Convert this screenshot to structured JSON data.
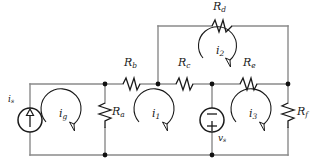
{
  "diagram": {
    "kind": "electrical-circuit-schematic",
    "title": "",
    "colors": {
      "wire": "#8a8a8a",
      "node": "#111111",
      "symbol": "#1a1a1a",
      "label": "#1a1a1a",
      "background": "#ffffff"
    },
    "components": [
      {
        "id": "Ra",
        "name": "resistor-Ra",
        "base": "R",
        "sub": "a",
        "orientation": "vertical",
        "label_x": 112,
        "label_y": 112
      },
      {
        "id": "Rb",
        "name": "resistor-Rb",
        "base": "R",
        "sub": "b",
        "orientation": "horizontal",
        "label_x": 124,
        "label_y": 63
      },
      {
        "id": "Rc",
        "name": "resistor-Rc",
        "base": "R",
        "sub": "c",
        "orientation": "horizontal",
        "label_x": 178,
        "label_y": 63
      },
      {
        "id": "Rd",
        "name": "resistor-Rd",
        "base": "R",
        "sub": "d",
        "orientation": "horizontal",
        "label_x": 213,
        "label_y": 5
      },
      {
        "id": "Re",
        "name": "resistor-Re",
        "base": "R",
        "sub": "e",
        "orientation": "horizontal",
        "label_x": 243,
        "label_y": 63
      },
      {
        "id": "Rf",
        "name": "resistor-Rf",
        "base": "R",
        "sub": "f",
        "orientation": "vertical",
        "label_x": 295,
        "label_y": 112
      },
      {
        "id": "is",
        "name": "current-source-is",
        "base": "i",
        "sub": "s",
        "kind": "current-source",
        "label_x": 8,
        "label_y": 97
      },
      {
        "id": "vs",
        "name": "voltage-source-vs",
        "base": "v",
        "sub": "s",
        "kind": "voltage-source",
        "polarity_top": "−",
        "polarity_bottom": "+",
        "label_x": 218,
        "label_y": 138
      }
    ],
    "mesh_currents": [
      {
        "id": "ig",
        "name": "mesh-current-ig",
        "base": "i",
        "sub": "g",
        "direction": "clockwise",
        "label_x": 60,
        "label_y": 113
      },
      {
        "id": "i1",
        "name": "mesh-current-i1",
        "base": "i",
        "sub": "1",
        "direction": "clockwise",
        "label_x": 153,
        "label_y": 113
      },
      {
        "id": "i2",
        "name": "mesh-current-i2",
        "base": "i",
        "sub": "2",
        "direction": "clockwise",
        "label_x": 218,
        "label_y": 50
      },
      {
        "id": "i3",
        "name": "mesh-current-i3",
        "base": "i",
        "sub": "3",
        "direction": "clockwise",
        "label_x": 250,
        "label_y": 113
      }
    ],
    "nodes": [
      {
        "name": "node-mid-left",
        "x": 105,
        "y": 84
      },
      {
        "name": "node-mid-bc",
        "x": 158,
        "y": 84
      },
      {
        "name": "node-mid-ce",
        "x": 212,
        "y": 84
      },
      {
        "name": "node-mid-right",
        "x": 288,
        "y": 84
      },
      {
        "name": "node-bot-left",
        "x": 105,
        "y": 155
      },
      {
        "name": "node-bot-mid",
        "x": 212,
        "y": 155
      }
    ]
  }
}
